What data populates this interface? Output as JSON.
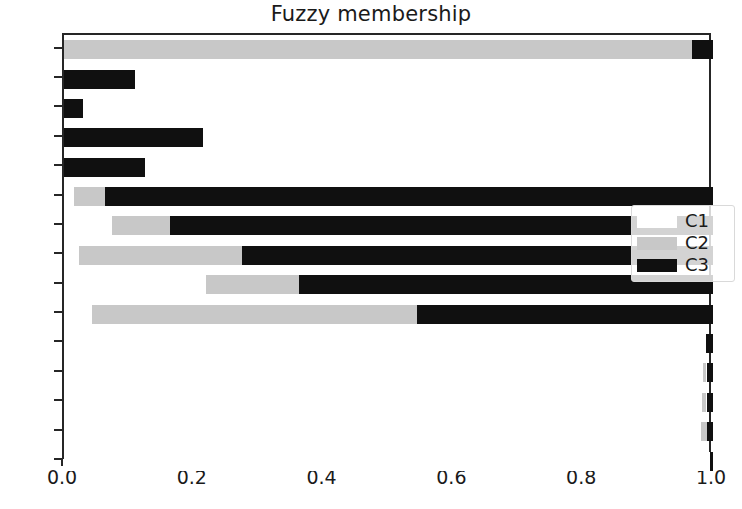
{
  "chart_data": {
    "type": "bar",
    "orientation": "horizontal",
    "stacked": true,
    "title": "Fuzzy membership",
    "xlabel": "",
    "ylabel": "",
    "xlim": [
      0.0,
      1.0
    ],
    "ylim": [
      0,
      145
    ],
    "grid": false,
    "legend_position": "center right",
    "x_ticks": [
      "0.0",
      "0.2",
      "0.4",
      "0.6",
      "0.8",
      "1.0"
    ],
    "x_tick_values": [
      0.0,
      0.2,
      0.4,
      0.6,
      0.8,
      1.0
    ],
    "y_ticks": [
      "0",
      "10",
      "20",
      "30",
      "40",
      "50",
      "60",
      "70",
      "80",
      "90",
      "100",
      "110",
      "120",
      "130",
      "140"
    ],
    "y_tick_values": [
      0,
      10,
      20,
      30,
      40,
      50,
      60,
      70,
      80,
      90,
      100,
      110,
      120,
      130,
      140
    ],
    "categories": [
      140,
      130,
      120,
      110,
      100,
      90,
      80,
      70,
      60,
      50,
      40,
      30,
      20,
      10,
      0
    ],
    "colors": {
      "C1": "#ffffff",
      "C2": "#c8c8c8",
      "C3": "#101010",
      "axis": "#262626",
      "text": "#1a1a1a",
      "background": "#ffffff"
    },
    "series": [
      {
        "name": "C1",
        "color": "#ffffff",
        "values": [
          0.0,
          0.0,
          0.0,
          0.0,
          0.0,
          0.015,
          0.074,
          0.023,
          0.219,
          0.043,
          0.989,
          0.985,
          0.983,
          0.982,
          0.995
        ]
      },
      {
        "name": "C2",
        "color": "#c8c8c8",
        "values": [
          0.967,
          0.0,
          0.0,
          0.0,
          0.0,
          0.048,
          0.089,
          0.251,
          0.143,
          0.501,
          0.0,
          0.005,
          0.007,
          0.008,
          0.0
        ]
      },
      {
        "name": "C3",
        "color": "#101010",
        "values": [
          0.033,
          0.11,
          0.03,
          0.214,
          0.125,
          0.937,
          0.837,
          0.726,
          0.638,
          0.456,
          0.011,
          0.01,
          0.01,
          0.01,
          0.005
        ]
      }
    ],
    "cumulative_edges": {
      "note": "running stack edges per category in order C1, C2, C3",
      "140": [
        0.0,
        0.967,
        1.0
      ],
      "130": [
        0.0,
        0.89,
        1.0
      ],
      "120": [
        0.0,
        0.97,
        1.0
      ],
      "110": [
        0.0,
        0.786,
        1.0
      ],
      "100": [
        0.0,
        0.875,
        1.0
      ],
      "90": [
        0.015,
        0.063,
        1.0
      ],
      "80": [
        0.074,
        0.163,
        1.0
      ],
      "70": [
        0.023,
        0.274,
        1.0
      ],
      "60": [
        0.219,
        0.362,
        1.0
      ],
      "50": [
        0.043,
        0.544,
        1.0
      ],
      "40": [
        0.989,
        0.989,
        1.0
      ],
      "30": [
        0.985,
        0.99,
        1.0
      ],
      "20": [
        0.983,
        0.99,
        1.0
      ],
      "10": [
        0.982,
        0.99,
        1.0
      ],
      "0": [
        0.995,
        0.995,
        1.0
      ]
    },
    "legend": [
      {
        "label": "C1",
        "color": "#ffffff"
      },
      {
        "label": "C2",
        "color": "#c8c8c8"
      },
      {
        "label": "C3",
        "color": "#101010"
      }
    ]
  }
}
